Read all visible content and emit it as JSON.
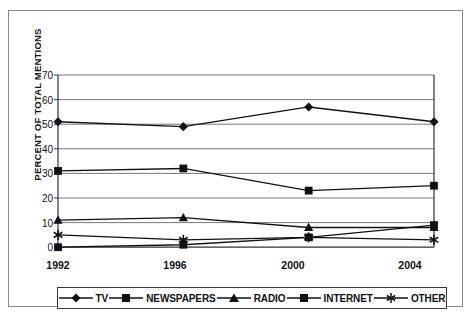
{
  "chart_data": {
    "type": "line",
    "title": "",
    "subtitle": "",
    "xlabel": "",
    "ylabel": "PERCENT OF TOTAL MENTIONS",
    "categories": [
      "1992",
      "1996",
      "2000",
      "2004"
    ],
    "x": [
      1992,
      1996,
      2000,
      2004
    ],
    "ylim": [
      0,
      70
    ],
    "yticks": [
      0,
      10,
      20,
      30,
      40,
      50,
      60,
      70
    ],
    "grid": "horizontal",
    "legend_position": "bottom",
    "series": [
      {
        "name": "TV",
        "marker": "diamond",
        "values": [
          51,
          49,
          57,
          51
        ]
      },
      {
        "name": "NEWSPAPERS",
        "marker": "square",
        "values": [
          31,
          32,
          23,
          25
        ]
      },
      {
        "name": "RADIO",
        "marker": "triangle",
        "values": [
          11,
          12,
          8,
          8
        ]
      },
      {
        "name": "INTERNET",
        "marker": "square",
        "values": [
          0,
          1,
          4,
          9
        ]
      },
      {
        "name": "OTHER",
        "marker": "star",
        "values": [
          5,
          3,
          4,
          3
        ]
      }
    ],
    "annotations": []
  },
  "legend": {
    "items": [
      {
        "label": "TV"
      },
      {
        "label": "NEWSPAPERS"
      },
      {
        "label": "RADIO"
      },
      {
        "label": "INTERNET"
      },
      {
        "label": "OTHER"
      }
    ]
  },
  "axes": {
    "y_label": "PERCENT OF TOTAL MENTIONS",
    "y_ticks": [
      "70",
      "60",
      "50",
      "40",
      "30",
      "20",
      "10",
      "0"
    ],
    "x_ticks": [
      "1992",
      "1996",
      "2000",
      "2004"
    ]
  }
}
